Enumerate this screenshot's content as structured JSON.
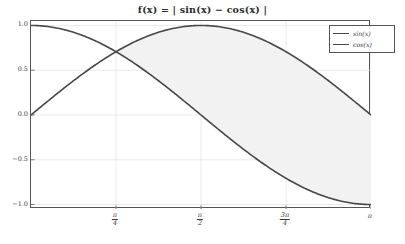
{
  "chart_data": {
    "type": "line",
    "title": "f(x) = | sin(x) − cos(x) |",
    "xlabel": "",
    "ylabel": "",
    "xlim": [
      0,
      3.14159265
    ],
    "ylim": [
      -1.05,
      1.05
    ],
    "grid": true,
    "legend_position": "upper right",
    "x_ticks": [
      {
        "value": 0.7853981634,
        "label": "π/4",
        "num": "π",
        "den": "4"
      },
      {
        "value": 1.5707963268,
        "label": "π/2",
        "num": "π",
        "den": "2"
      },
      {
        "value": 2.3561944902,
        "label": "3π/4",
        "num": "3π",
        "den": "4"
      },
      {
        "value": 3.1415926536,
        "label": "π",
        "num": "π",
        "den": ""
      }
    ],
    "y_ticks": [
      {
        "value": 1.0,
        "label": "1.0"
      },
      {
        "value": 0.5,
        "label": "0.5"
      },
      {
        "value": 0.0,
        "label": "0.0"
      },
      {
        "value": -0.5,
        "label": "−0.5"
      },
      {
        "value": -1.0,
        "label": "−1.0"
      }
    ],
    "series": [
      {
        "name": "sin(x)",
        "color": "#474747",
        "x": [
          0.0,
          0.15708,
          0.31416,
          0.47124,
          0.62832,
          0.7854,
          0.94248,
          1.09956,
          1.25664,
          1.41372,
          1.5708,
          1.72788,
          1.88496,
          2.04204,
          2.19911,
          2.35619,
          2.51327,
          2.67035,
          2.82743,
          2.98451,
          3.14159
        ],
        "y": [
          0.0,
          0.15643,
          0.30902,
          0.45399,
          0.58779,
          0.70711,
          0.80902,
          0.89101,
          0.95106,
          0.98769,
          1.0,
          0.98769,
          0.95106,
          0.89101,
          0.80902,
          0.70711,
          0.58779,
          0.45399,
          0.30902,
          0.15643,
          0.0
        ]
      },
      {
        "name": "cos(x)",
        "color": "#474747",
        "x": [
          0.0,
          0.15708,
          0.31416,
          0.47124,
          0.62832,
          0.7854,
          0.94248,
          1.09956,
          1.25664,
          1.41372,
          1.5708,
          1.72788,
          1.88496,
          2.04204,
          2.19911,
          2.35619,
          2.51327,
          2.67035,
          2.82743,
          2.98451,
          3.14159
        ],
        "y": [
          1.0,
          0.98769,
          0.95106,
          0.89101,
          0.80902,
          0.70711,
          0.58779,
          0.45399,
          0.30902,
          0.15643,
          0.0,
          -0.15643,
          -0.30902,
          -0.45399,
          -0.58779,
          -0.70711,
          -0.80902,
          -0.89101,
          -0.95106,
          -0.98769,
          -1.0
        ]
      }
    ],
    "fill_between": {
      "label": "|sin(x) - cos(x)|",
      "color": "#f2f2f2",
      "from_x": 0.7853981634,
      "to_x": 3.14159265
    },
    "legend": [
      {
        "label": "sin(x)",
        "color": "#474747"
      },
      {
        "label": "cos(x)",
        "color": "#474747"
      }
    ]
  },
  "figure": {
    "background": "#ffffff",
    "frame_color": "#555555",
    "grid_color": "#e3e3e3",
    "tick_text_color": "#3a3a3a"
  }
}
